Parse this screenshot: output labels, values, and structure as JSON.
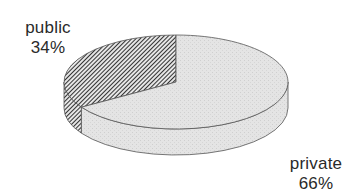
{
  "chart_data": {
    "type": "pie",
    "style": "3d",
    "title": "",
    "slices": [
      {
        "label": "public",
        "value": 34,
        "value_label": "34%",
        "fill": "hatched",
        "color": "#4a4a4a"
      },
      {
        "label": "private",
        "value": 66,
        "value_label": "66%",
        "fill": "dotted-light",
        "color": "#e2e2e2"
      }
    ],
    "start": "top",
    "direction": "counterclockwise-for-first-slice",
    "legend": "none",
    "labels_placement": "outside"
  }
}
